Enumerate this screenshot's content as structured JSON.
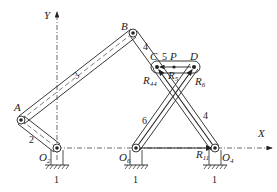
{
  "diagram": {
    "type": "planar linkage mechanism",
    "axes": {
      "x_label": "X",
      "y_label": "Y"
    },
    "joints": {
      "A": "A",
      "B": "B",
      "C": "C",
      "D": "D",
      "P": "P",
      "O2": "O",
      "O2_sub": "2",
      "O6": "O",
      "O6_sub": "6",
      "O4": "O",
      "O4_sub": "4"
    },
    "links": {
      "link2": "2",
      "link3": "3",
      "link4": "4",
      "link5": "5",
      "link6": "6",
      "ground_a": "1",
      "ground_b": "1",
      "ground_c": "1"
    },
    "vectors": {
      "R44": "R",
      "R44_sub": "44",
      "R5": "R",
      "R5_sub": "5",
      "R6": "R",
      "R6_sub": "6",
      "R11": "R",
      "R11_sub": "11"
    },
    "colors": {
      "line": "#222222",
      "background": "#ffffff"
    }
  }
}
